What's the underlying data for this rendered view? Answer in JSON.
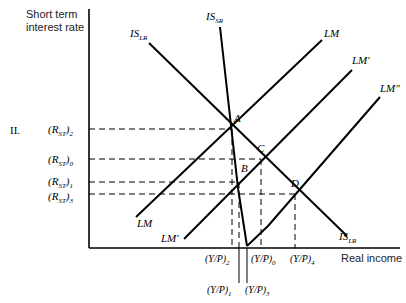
{
  "panel_label": "II.",
  "axes": {
    "y_label_line1": "Short term",
    "y_label_line2": "interest rate",
    "x_label": "Real income"
  },
  "curves": {
    "is_lr": {
      "base": "IS",
      "sub": "LR"
    },
    "is_lr_bottom": {
      "base": "IS",
      "sub": "LR"
    },
    "is_sr": {
      "base": "IS",
      "sub": "SR"
    },
    "lm": "LM",
    "lm_bottom": "LM",
    "lm_prime": "LM′",
    "lm_prime_bottom": "LM′",
    "lm_double_prime": "LM″"
  },
  "points": {
    "a": "A",
    "b": "B",
    "c": "C",
    "d": "D"
  },
  "y_ticks": [
    {
      "base": "(R",
      "sub": "ST",
      "close": ")",
      "idx": "2"
    },
    {
      "base": "(R",
      "sub": "ST",
      "close": ")",
      "idx": "0"
    },
    {
      "base": "(R",
      "sub": "ST",
      "close": ")",
      "idx": "1"
    },
    {
      "base": "(R",
      "sub": "ST",
      "close": ")",
      "idx": "3"
    }
  ],
  "x_ticks": [
    {
      "text": "(Y/P)",
      "idx": "2"
    },
    {
      "text": "(Y/P)",
      "idx": "0"
    },
    {
      "text": "(Y/P)",
      "idx": "4"
    },
    {
      "text": "(Y/P)",
      "idx": "1"
    },
    {
      "text": "(Y/P)",
      "idx": "3"
    }
  ]
}
